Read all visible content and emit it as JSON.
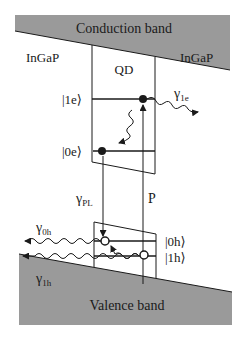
{
  "diagram": {
    "colors": {
      "band_fill": "#9a9a9a",
      "line": "#1a1a1a",
      "background": "#ffffff"
    },
    "bands": {
      "conduction": {
        "label": "Conduction band"
      },
      "valence": {
        "label": "Valence band"
      }
    },
    "materials": {
      "barrier_left": "InGaP",
      "barrier_right": "InGaP",
      "dot": "QD"
    },
    "levels": {
      "e1": "|1e⟩",
      "e0": "|0e⟩",
      "h0": "|0h⟩",
      "h1": "|1h⟩"
    },
    "rates": {
      "gamma_1e": {
        "symbol": "γ",
        "sub": "1e"
      },
      "gamma_PL": {
        "symbol": "γ",
        "sub": "PL"
      },
      "gamma_0h": {
        "symbol": "γ",
        "sub": "0h"
      },
      "gamma_1h": {
        "symbol": "γ",
        "sub": "1h"
      }
    },
    "pump": "P"
  }
}
